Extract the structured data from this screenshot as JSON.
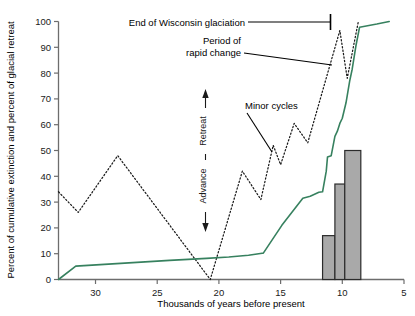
{
  "chart_data": {
    "type": "line",
    "title": "",
    "xlabel": "Thousands of years before present",
    "ylabel": "Percent of cumulative extinction and percent of glacial retreat",
    "xlim": [
      33,
      5
    ],
    "ylim": [
      0,
      100
    ],
    "x_reversed": true,
    "grid": false,
    "legend": "none",
    "xticks": [
      30,
      25,
      20,
      15,
      10,
      5
    ],
    "yticks": [
      0,
      10,
      20,
      30,
      40,
      50,
      60,
      70,
      80,
      90,
      100
    ],
    "series": [
      {
        "name": "Percent of cumulative extinction",
        "style": "solid",
        "color": "#37815f",
        "points": [
          [
            33.0,
            0
          ],
          [
            31.6,
            5.2
          ],
          [
            24.0,
            7.4
          ],
          [
            21.0,
            8.2
          ],
          [
            19.2,
            8.7
          ],
          [
            17.6,
            9.4
          ],
          [
            16.5,
            10.2
          ],
          [
            16.4,
            10.2
          ],
          [
            14.9,
            21.0
          ],
          [
            13.2,
            31.5
          ],
          [
            12.6,
            32.3
          ],
          [
            11.9,
            33.8
          ],
          [
            11.6,
            34.0
          ],
          [
            11.3,
            42.0
          ],
          [
            11.2,
            47.5
          ],
          [
            10.9,
            48.0
          ],
          [
            10.6,
            55.5
          ],
          [
            10.4,
            57.5
          ],
          [
            10.2,
            60.5
          ],
          [
            10.0,
            62.5
          ],
          [
            9.7,
            68.5
          ],
          [
            9.4,
            77.0
          ],
          [
            9.2,
            81.5
          ],
          [
            8.9,
            90.5
          ],
          [
            8.6,
            97.8
          ],
          [
            7.2,
            99.0
          ],
          [
            6.2,
            100.0
          ]
        ]
      },
      {
        "name": "Glacial retreat (percent of glacial retreat)",
        "style": "dotted",
        "color": "#1a1a1a",
        "points": [
          [
            33.0,
            34.0
          ],
          [
            31.4,
            26.0
          ],
          [
            28.2,
            48.0
          ],
          [
            20.7,
            0.0
          ],
          [
            18.1,
            42.0
          ],
          [
            16.6,
            31.0
          ],
          [
            15.6,
            52.0
          ],
          [
            15.0,
            44.5
          ],
          [
            13.9,
            60.5
          ],
          [
            12.8,
            53.0
          ],
          [
            10.2,
            96.5
          ],
          [
            9.6,
            78.0
          ],
          [
            8.7,
            100.0
          ]
        ]
      }
    ],
    "bars": {
      "name": "Extinction episodes",
      "color": "#a9a9a9",
      "edge_color": "#2b2b2b",
      "items": [
        {
          "x_start": 11.6,
          "x_end": 10.6,
          "value": 17
        },
        {
          "x_start": 10.6,
          "x_end": 9.8,
          "value": 37
        },
        {
          "x_start": 9.8,
          "x_end": 8.5,
          "value": 50
        }
      ]
    },
    "annotations": [
      {
        "name": "end-of-wisconsin-glaciation",
        "text": "End of Wisconsin glaciation",
        "target_x": 10.2,
        "target_y": 100
      },
      {
        "name": "period-of-rapid-change",
        "text_line1": "Period of",
        "text_line2": "rapid change",
        "target_x": 9.8,
        "target_y": 82
      },
      {
        "name": "minor-cycles",
        "text": "Minor cycles",
        "target_x": 15.6,
        "target_y": 52
      },
      {
        "name": "retreat-arrow-label",
        "text": "Retreat"
      },
      {
        "name": "advance-arrow-label",
        "text": "Advance"
      }
    ]
  },
  "axes": {
    "y_label": "Percent of cumulative extinction and percent of glacial retreat",
    "x_label": "Thousands of years before present",
    "y_ticks": [
      "0",
      "10",
      "20",
      "30",
      "40",
      "50",
      "60",
      "70",
      "80",
      "90",
      "100"
    ],
    "x_ticks": [
      "30",
      "25",
      "20",
      "15",
      "10",
      "5"
    ]
  },
  "annotations": {
    "end_glaciation": "End of Wisconsin glaciation",
    "rapid_change_l1": "Period of",
    "rapid_change_l2": "rapid change",
    "minor_cycles": "Minor cycles",
    "retreat": "Retreat",
    "advance": "Advance"
  },
  "colors": {
    "extinction_line": "#37815f",
    "glacial_line": "#1a1a1a",
    "bar_fill": "#a9a9a9",
    "bar_edge": "#2b2b2b",
    "axis": "#6d6d6d"
  }
}
